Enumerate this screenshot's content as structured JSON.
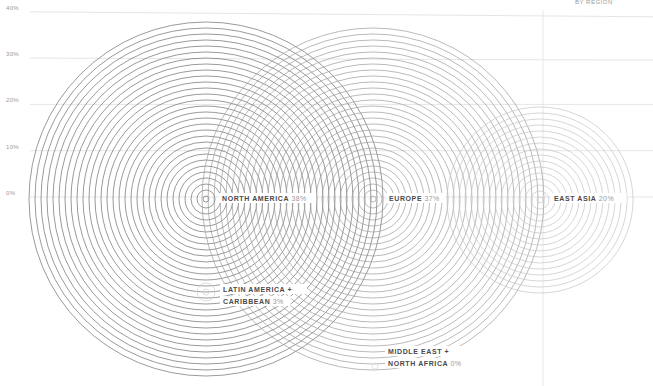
{
  "chart_data": {
    "type": "bubble-concentric",
    "title": "",
    "subtitle": "BY REGION",
    "ylabel": "",
    "ylim": [
      0,
      40
    ],
    "y_ticks": [
      "40%",
      "30%",
      "20%",
      "10%",
      "0%"
    ],
    "y_tick_values": [
      40,
      30,
      20,
      10,
      0
    ],
    "grid": true,
    "series": [
      {
        "name_lines": [
          "NORTH AMERICA"
        ],
        "value_label": "38%",
        "value": 38
      },
      {
        "name_lines": [
          "EUROPE"
        ],
        "value_label": "37%",
        "value": 37
      },
      {
        "name_lines": [
          "EAST ASIA"
        ],
        "value_label": "20%",
        "value": 20
      },
      {
        "name_lines": [
          "LATIN AMERICA +",
          "CARIBBEAN"
        ],
        "value_label": "3%",
        "value": 3
      },
      {
        "name_lines": [
          "MIDDLE EAST +",
          "NORTH AFRICA"
        ],
        "value_label": "0%",
        "value": 0
      }
    ]
  }
}
